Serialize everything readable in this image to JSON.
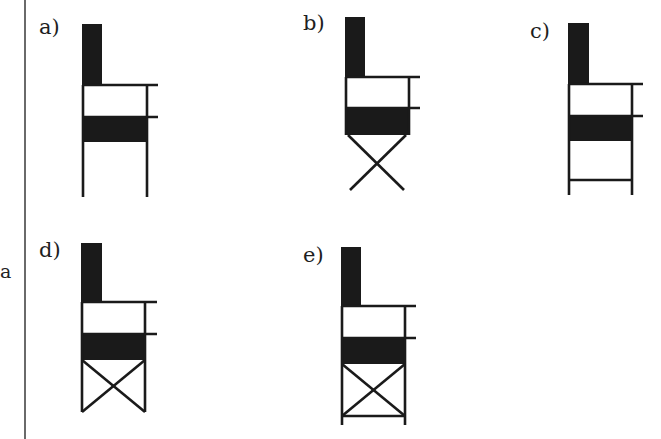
{
  "side_label": "a",
  "figures": [
    {
      "id": "a",
      "label": "a)",
      "leg_style": "straight-legs"
    },
    {
      "id": "b",
      "label": "b)",
      "leg_style": "x-legs"
    },
    {
      "id": "c",
      "label": "c)",
      "leg_style": "legs-with-crossbar"
    },
    {
      "id": "d",
      "label": "d)",
      "leg_style": "boxed-x"
    },
    {
      "id": "e",
      "label": "e)",
      "leg_style": "boxed-x-with-bottom-bar"
    }
  ],
  "colors": {
    "ink": "#1a1a1a",
    "rule": "#6a6a6a",
    "background": "#ffffff"
  }
}
